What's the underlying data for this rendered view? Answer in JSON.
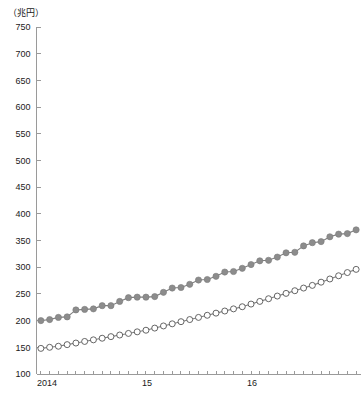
{
  "axis": {
    "unit_label": "（兆円）",
    "y_ticks": [
      750,
      700,
      650,
      600,
      550,
      500,
      450,
      400,
      350,
      300,
      250,
      200,
      150,
      100
    ],
    "x_tick_labels": [
      "2014",
      "15",
      "16"
    ]
  },
  "chart_data": {
    "type": "line",
    "title": "",
    "xlabel": "",
    "ylabel": "（兆円）",
    "ylim": [
      100,
      750
    ],
    "grid": false,
    "legend": "none",
    "x": [
      "2014-01",
      "2014-02",
      "2014-03",
      "2014-04",
      "2014-05",
      "2014-06",
      "2014-07",
      "2014-08",
      "2014-09",
      "2014-10",
      "2014-11",
      "2014-12",
      "2015-01",
      "2015-02",
      "2015-03",
      "2015-04",
      "2015-05",
      "2015-06",
      "2015-07",
      "2015-08",
      "2015-09",
      "2015-10",
      "2015-11",
      "2015-12",
      "2016-01",
      "2016-02",
      "2016-03",
      "2016-04",
      "2016-05",
      "2016-06",
      "2016-07",
      "2016-08",
      "2016-09",
      "2016-10",
      "2016-11",
      "2016-12",
      "2017-01"
    ],
    "x_tick_positions": [
      0,
      12,
      24
    ],
    "series": [
      {
        "name": "series-filled",
        "marker": "filled-circle",
        "color": "#8c8c8c",
        "values": [
          200,
          202,
          206,
          207,
          220,
          221,
          222,
          228,
          228,
          236,
          243,
          244,
          244,
          245,
          253,
          261,
          262,
          268,
          276,
          277,
          283,
          291,
          292,
          298,
          305,
          312,
          313,
          319,
          327,
          328,
          340,
          346,
          348,
          357,
          362,
          363,
          370
        ]
      },
      {
        "name": "series-open",
        "marker": "open-circle",
        "color": "#ffffff",
        "values": [
          148,
          150,
          152,
          155,
          158,
          161,
          164,
          167,
          170,
          173,
          176,
          179,
          182,
          186,
          190,
          194,
          198,
          202,
          206,
          210,
          214,
          218,
          222,
          226,
          231,
          236,
          241,
          246,
          251,
          256,
          261,
          266,
          272,
          278,
          284,
          290,
          296
        ]
      }
    ]
  }
}
